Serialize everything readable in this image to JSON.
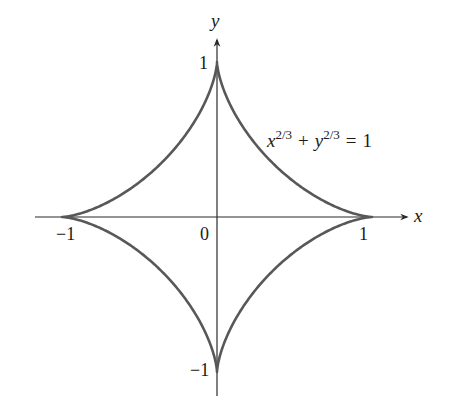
{
  "figure": {
    "type": "astroid",
    "equation": {
      "x_var": "x",
      "x_exp": "2/3",
      "plus": "+",
      "y_var": "y",
      "y_exp": "2/3",
      "equals": "=",
      "rhs": "1"
    },
    "axes": {
      "x_label": "x",
      "y_label": "y"
    },
    "ticks": {
      "x_neg": "−1",
      "x_pos": "1",
      "origin": "0",
      "y_pos": "1",
      "y_neg": "−1"
    },
    "colors": {
      "curve": "#585858",
      "axis": "#2a2a2a",
      "text": "#1a1a1a"
    }
  }
}
